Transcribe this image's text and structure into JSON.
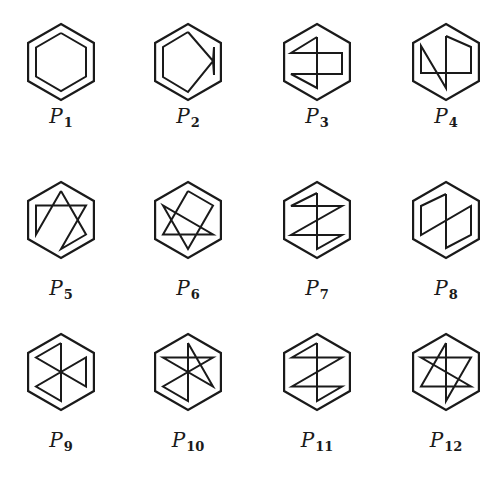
{
  "figure": {
    "stroke_color": "#1a1a1a",
    "outer_radius": 38,
    "inner_vertices": {
      "T": [
        0,
        -29
      ],
      "UR": [
        25,
        -14.5
      ],
      "LR": [
        25,
        14.5
      ],
      "B": [
        0,
        29
      ],
      "LL": [
        -25,
        14.5
      ],
      "UL": [
        -25,
        -14.5
      ],
      "C": [
        0,
        0
      ]
    },
    "panels": [
      {
        "id": "P1",
        "label_main": "P",
        "label_sub": "1",
        "cx": 61,
        "cy": 62,
        "label_y": 118,
        "path": [
          "T",
          "UR",
          "LR",
          "B",
          "LL",
          "UL",
          "T"
        ]
      },
      {
        "id": "P2",
        "label_main": "P",
        "label_sub": "2",
        "cx": 188,
        "cy": 62,
        "label_y": 118,
        "path": [
          "T",
          "C2",
          "LRr",
          "URr",
          "C2",
          "B",
          "LL",
          "UL",
          "T"
        ]
      },
      {
        "id": "P3",
        "label_main": "P",
        "label_sub": "3",
        "cx": 317,
        "cy": 62,
        "label_y": 118,
        "path": [
          "Tc",
          "ULm",
          "URm",
          "LRm",
          "LLm",
          "Bc",
          "Tc"
        ]
      },
      {
        "id": "P4",
        "label_main": "P",
        "label_sub": "4",
        "cx": 446,
        "cy": 62,
        "label_y": 118,
        "path": [
          "Tc",
          "URm",
          "LRm",
          "LLm",
          "ULm",
          "Bc",
          "Tc"
        ]
      },
      {
        "id": "P5",
        "label_main": "P",
        "label_sub": "5",
        "cx": 61,
        "cy": 220,
        "label_y": 290,
        "path": [
          "T",
          "LR",
          "B",
          "UR",
          "UL",
          "LL",
          "T"
        ]
      },
      {
        "id": "P6",
        "label_main": "P",
        "label_sub": "6",
        "cx": 188,
        "cy": 220,
        "label_y": 290,
        "path": [
          "T",
          "UR",
          "B",
          "UL",
          "LR",
          "LL",
          "T"
        ]
      },
      {
        "id": "P7",
        "label_main": "P",
        "label_sub": "7",
        "cx": 317,
        "cy": 220,
        "label_y": 290,
        "path": [
          "Tc",
          "ULm",
          "URm",
          "LLm",
          "LRm",
          "Bc",
          "Tc"
        ]
      },
      {
        "id": "P8",
        "label_main": "P",
        "label_sub": "8",
        "cx": 446,
        "cy": 220,
        "label_y": 290,
        "path": [
          "Tc",
          "Bc",
          "LR",
          "UR",
          "LL",
          "UL",
          "Tc"
        ]
      },
      {
        "id": "P9",
        "label_main": "P",
        "label_sub": "9",
        "cx": 61,
        "cy": 372,
        "label_y": 442,
        "path": [
          "T",
          "UL",
          "LR",
          "UR",
          "LL",
          "B",
          "T"
        ]
      },
      {
        "id": "P10",
        "label_main": "P",
        "label_sub": "10",
        "cx": 188,
        "cy": 372,
        "label_y": 442,
        "path": [
          "T",
          "LR",
          "UL",
          "UR",
          "LL",
          "B",
          "T"
        ]
      },
      {
        "id": "P11",
        "label_main": "P",
        "label_sub": "11",
        "cx": 317,
        "cy": 372,
        "label_y": 442,
        "path": [
          "T",
          "UL",
          "UR",
          "LL",
          "LR",
          "B",
          "T"
        ]
      },
      {
        "id": "P12",
        "label_main": "P",
        "label_sub": "12",
        "cx": 446,
        "cy": 372,
        "label_y": 442,
        "path": [
          "T",
          "B",
          "UR",
          "UL",
          "LR",
          "LL",
          "T"
        ]
      }
    ]
  }
}
